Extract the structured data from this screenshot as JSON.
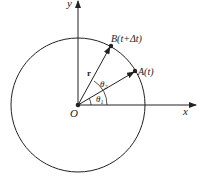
{
  "diagram": {
    "title": "",
    "axes": {
      "x_label": "x",
      "y_label": "y"
    },
    "origin_label": "O",
    "points": [
      {
        "id": "A",
        "label": "A(t)"
      },
      {
        "id": "B",
        "label": "B(t+Δt)"
      }
    ],
    "vector_label": "r",
    "angles": [
      {
        "id": "theta1",
        "label": "θ",
        "sub": "1"
      },
      {
        "id": "theta2",
        "label": "θ",
        "sub": "2"
      }
    ],
    "colors": {
      "stroke": "#222222",
      "background": "#ffffff"
    }
  }
}
